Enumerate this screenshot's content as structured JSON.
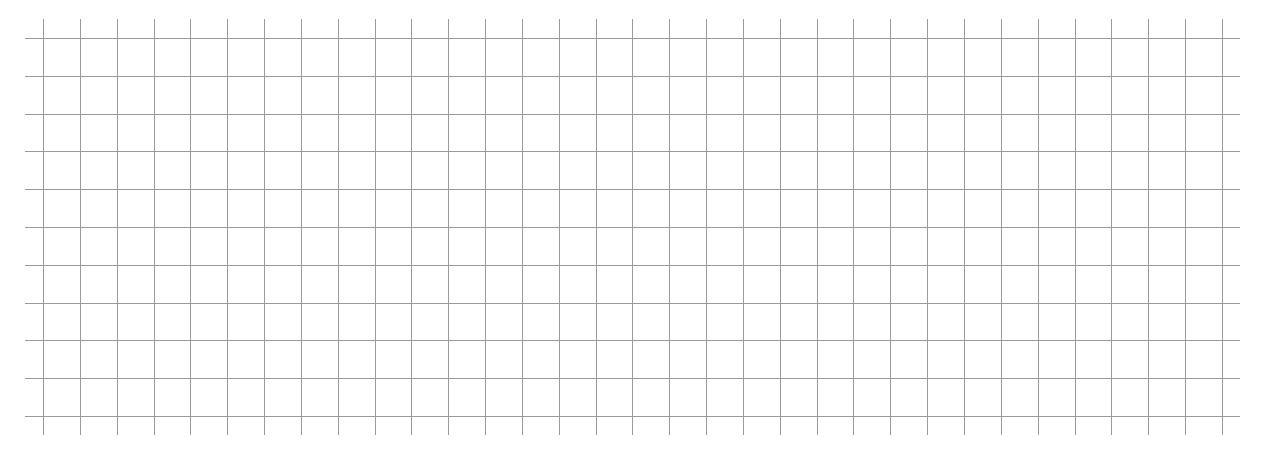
{
  "grid": {
    "line_color": "#9a9a9a",
    "background": "#ffffff",
    "vertical": {
      "count": 33,
      "first_x": 43,
      "spacing": 36.84,
      "top": 19,
      "bottom": 435
    },
    "horizontal": {
      "count": 11,
      "first_y": 38,
      "spacing": 37.8,
      "left": 25,
      "right": 1240
    }
  }
}
